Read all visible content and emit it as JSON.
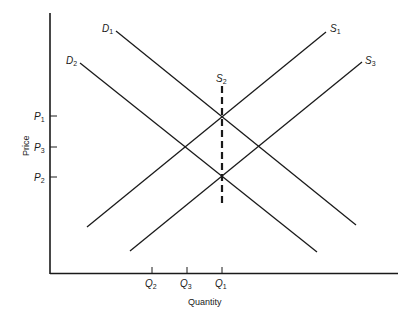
{
  "diagram": {
    "type": "supply-demand",
    "axes": {
      "x_label": "Quantity",
      "y_label": "Price"
    },
    "price_ticks": [
      {
        "id": "P1",
        "letter": "P",
        "sub": "1",
        "y": 116
      },
      {
        "id": "P3",
        "letter": "P",
        "sub": "3",
        "y": 147
      },
      {
        "id": "P2",
        "letter": "P",
        "sub": "2",
        "y": 177
      }
    ],
    "quantity_ticks": [
      {
        "id": "Q2",
        "letter": "Q",
        "sub": "2",
        "x": 152
      },
      {
        "id": "Q3",
        "letter": "Q",
        "sub": "3",
        "x": 187
      },
      {
        "id": "Q1",
        "letter": "Q",
        "sub": "1",
        "x": 222
      }
    ],
    "curves": {
      "D1": {
        "letter": "D",
        "sub": "1",
        "style": "solid"
      },
      "D2": {
        "letter": "D",
        "sub": "2",
        "style": "solid"
      },
      "S1": {
        "letter": "S",
        "sub": "1",
        "style": "solid"
      },
      "S2": {
        "letter": "S",
        "sub": "2",
        "style": "dashed",
        "note": "vertical (perfectly inelastic) supply"
      },
      "S3": {
        "letter": "S",
        "sub": "3",
        "style": "solid"
      }
    },
    "colors": {
      "line": "#1a1a1a",
      "background": "#ffffff"
    }
  }
}
